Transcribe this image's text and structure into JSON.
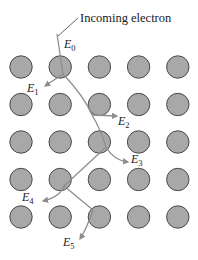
{
  "diagram": {
    "title": "Incoming electron",
    "lattice": {
      "rows": 5,
      "cols": 5
    },
    "energy_labels": [
      {
        "id": "E0",
        "base": "E",
        "sub": "0"
      },
      {
        "id": "E1",
        "base": "E",
        "sub": "1"
      },
      {
        "id": "E2",
        "base": "E",
        "sub": "2"
      },
      {
        "id": "E3",
        "base": "E",
        "sub": "3"
      },
      {
        "id": "E4",
        "base": "E",
        "sub": "4"
      },
      {
        "id": "E5",
        "base": "E",
        "sub": "5"
      }
    ],
    "colors": {
      "atom_fill": "#a8a8a8",
      "atom_stroke": "#4a4a4a",
      "path": "#8e8e8e",
      "text": "#1a1a1a"
    }
  }
}
